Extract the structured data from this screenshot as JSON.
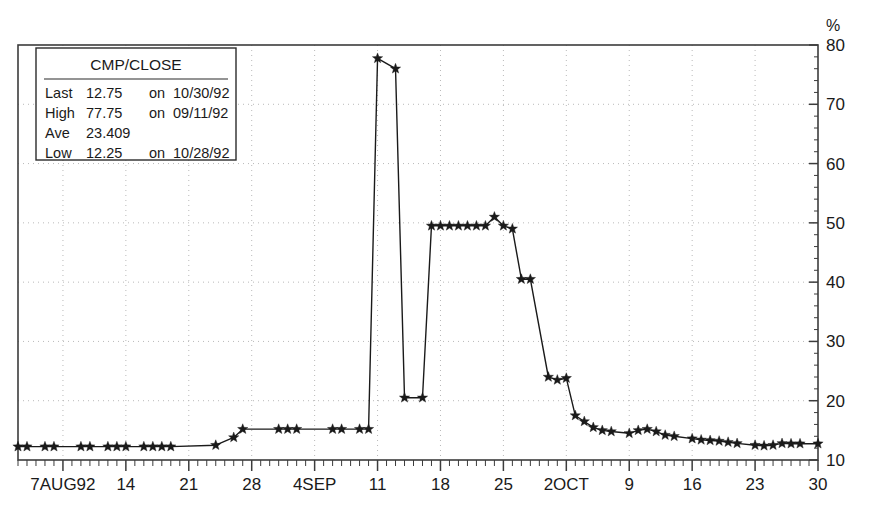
{
  "chart_data": {
    "type": "line",
    "title": "",
    "xlabel": "",
    "ylabel": "%",
    "ylim": [
      10,
      80
    ],
    "yticks": [
      10,
      20,
      30,
      40,
      50,
      60,
      70,
      80
    ],
    "ytick_labels": [
      "10",
      "20",
      "30",
      "40",
      "50",
      "60",
      "70",
      "80"
    ],
    "y_minor_step": 2,
    "grid": "dotted-both",
    "legend_position": "top-left-box",
    "marker": "star",
    "line_color": "#1a1a1a",
    "marker_color": "#1a1a1a",
    "xtick_labels": [
      "7AUG92",
      "14",
      "21",
      "28",
      "4SEP",
      "11",
      "18",
      "25",
      "2OCT",
      "9",
      "16",
      "23",
      "30"
    ],
    "xtick_positions": [
      7,
      14,
      21,
      28,
      35,
      42,
      49,
      56,
      63,
      70,
      77,
      84,
      91
    ],
    "xlim": [
      2,
      91
    ],
    "x_minor_step": 1,
    "x": [
      2,
      3,
      5,
      6,
      9,
      10,
      12,
      13,
      14,
      16,
      17,
      18,
      19,
      24,
      26,
      27,
      31,
      32,
      33,
      37,
      38,
      40,
      41,
      42,
      44,
      45,
      47,
      48,
      49,
      50,
      51,
      52,
      53,
      54,
      55,
      56,
      57,
      58,
      59,
      61,
      62,
      63,
      64,
      65,
      66,
      67,
      68,
      70,
      71,
      72,
      73,
      74,
      75,
      77,
      78,
      79,
      80,
      81,
      82,
      84,
      85,
      86,
      87,
      88,
      89,
      91
    ],
    "y": [
      12.25,
      12.25,
      12.25,
      12.25,
      12.25,
      12.25,
      12.25,
      12.25,
      12.25,
      12.25,
      12.25,
      12.25,
      12.25,
      12.5,
      13.8,
      15.2,
      15.2,
      15.2,
      15.2,
      15.2,
      15.2,
      15.2,
      15.2,
      77.75,
      76.0,
      20.5,
      20.5,
      49.5,
      49.5,
      49.5,
      49.5,
      49.5,
      49.5,
      49.5,
      51.0,
      49.5,
      49.0,
      40.5,
      40.5,
      24.0,
      23.5,
      23.8,
      17.5,
      16.5,
      15.5,
      15.0,
      14.8,
      14.5,
      15.0,
      15.2,
      14.8,
      14.2,
      14.0,
      13.6,
      13.4,
      13.3,
      13.2,
      13.0,
      12.8,
      12.5,
      12.4,
      12.5,
      12.8,
      12.75,
      12.75,
      12.75
    ],
    "legend": {
      "title": "CMP/CLOSE",
      "rows": [
        {
          "label": "Last",
          "value": "12.75",
          "on": "on",
          "date": "10/30/92"
        },
        {
          "label": "High",
          "value": "77.75",
          "on": "on",
          "date": "09/11/92"
        },
        {
          "label": "Ave",
          "value": "23.409",
          "on": "",
          "date": ""
        },
        {
          "label": "Low",
          "value": "12.25",
          "on": "on",
          "date": "10/28/92"
        }
      ]
    }
  }
}
